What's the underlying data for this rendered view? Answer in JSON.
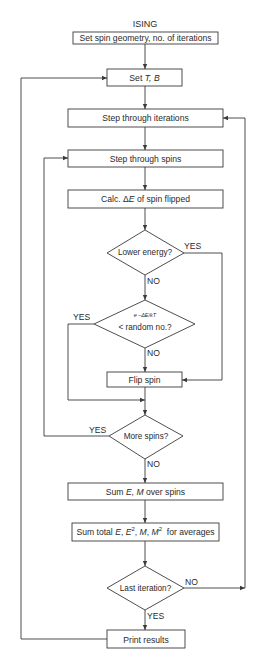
{
  "title": "ISING",
  "nodes": {
    "set_geometry": {
      "label": "Set spin geometry, no. of iterations"
    },
    "set_tb": {
      "label_prefix": "Set ",
      "label_vars": "T, B"
    },
    "step_iterations": {
      "label": "Step through iterations"
    },
    "step_spins": {
      "label": "Step through spins"
    },
    "calc_de": {
      "label_prefix": "Calc. Δ",
      "label_var": "E",
      "label_suffix": " of spin flipped"
    },
    "lower_energy": {
      "label": "Lower energy?"
    },
    "boltzmann": {
      "label_top": "e −ΔE/kT",
      "label_bottom": "< random no.?"
    },
    "flip_spin": {
      "label": "Flip spin"
    },
    "more_spins": {
      "label": "More spins?"
    },
    "sum_em": {
      "label_prefix": "Sum ",
      "label_vars": "E, M",
      "label_suffix": " over spins"
    },
    "sum_total": {
      "label_prefix": "Sum total ",
      "v1": "E",
      "v2": "E",
      "s2": "2",
      "v3": "M",
      "v4": "M",
      "s4": "2",
      "label_suffix": "  for averages"
    },
    "last_iteration": {
      "label": "Last iteration?"
    },
    "print_results": {
      "label": "Print results"
    }
  },
  "edge_labels": {
    "lower_energy_yes": "YES",
    "lower_energy_no": "NO",
    "boltzmann_yes": "YES",
    "boltzmann_no": "NO",
    "more_spins_yes": "YES",
    "more_spins_no": "NO",
    "last_iteration_no": "NO",
    "last_iteration_yes": "YES"
  },
  "colors": {
    "line": "#3a3a3a",
    "background": "#ffffff"
  }
}
